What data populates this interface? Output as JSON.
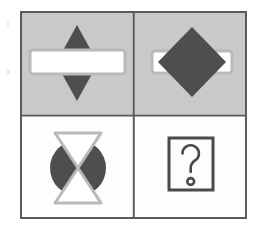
{
  "puzzle": {
    "type": "matrix-reasoning-analogy",
    "title": "Visual analogy puzzle",
    "grid": {
      "rows": 2,
      "columns": 2
    },
    "frame": {
      "x": 20,
      "y": 11,
      "width": 227,
      "height": 208,
      "border_color": "#5a5a5a",
      "border_width": 2,
      "divider_color": "#5a5a5a",
      "divider_width": 2
    },
    "colors": {
      "canvas": "#ffffff",
      "cell_gray": "#c9c9c9",
      "cell_white": "#fdfdfd",
      "shape_dark": "#4e4e4e",
      "shape_white": "#ffffff",
      "shape_outline_light": "#b8b8b8",
      "glyph_dark": "#4a4a4a",
      "border": "#5a5a5a"
    },
    "cells": [
      {
        "id": "cell-top-left",
        "position": "top-left",
        "background": "gray",
        "order": "bar-in-front-of-diamond",
        "shapes": [
          {
            "name": "diamond",
            "fill": "dark",
            "size": "small",
            "layer": "back"
          },
          {
            "name": "horizontal-bar",
            "fill": "white",
            "size": "wide",
            "layer": "front"
          }
        ]
      },
      {
        "id": "cell-top-right",
        "position": "top-right",
        "background": "gray",
        "order": "diamond-in-front-of-bar",
        "shapes": [
          {
            "name": "horizontal-bar",
            "fill": "white",
            "size": "wide",
            "layer": "back"
          },
          {
            "name": "diamond",
            "fill": "dark",
            "size": "large",
            "layer": "front"
          }
        ]
      },
      {
        "id": "cell-bottom-left",
        "position": "bottom-left",
        "background": "white",
        "order": "hourglass-in-front-of-circle",
        "shapes": [
          {
            "name": "circle",
            "fill": "dark",
            "size": "medium",
            "layer": "back"
          },
          {
            "name": "hourglass",
            "fill": "white",
            "size": "tall",
            "layer": "front"
          }
        ]
      },
      {
        "id": "cell-bottom-right",
        "position": "bottom-right",
        "background": "white",
        "order": "answer-placeholder",
        "answer_placeholder": {
          "glyph": "?",
          "box": true,
          "label": "question-mark"
        },
        "shapes": []
      }
    ]
  }
}
